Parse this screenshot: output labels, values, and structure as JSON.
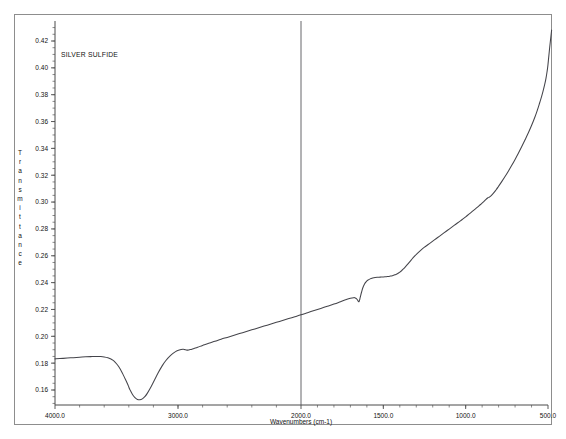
{
  "figure": {
    "series_title": "SILVER SULFIDE"
  },
  "axes": {
    "x_title": "Wavenumbers (cm-1)",
    "y_title": "Transmittance",
    "y_title_letters": [
      "T",
      "r",
      "a",
      "n",
      "s",
      "m",
      "i",
      "t",
      "t",
      "a",
      "n",
      "c",
      "e"
    ]
  },
  "chart_data": {
    "type": "line",
    "title": "SILVER SULFIDE",
    "xlabel": "Wavenumbers (cm-1)",
    "ylabel": "Transmittance",
    "xlim": [
      4000.0,
      500.0
    ],
    "ylim": [
      0.15,
      0.432
    ],
    "x_axis_inverted": true,
    "x_axis_split": {
      "note": "piecewise scale: 4000-2000 compressed, 2000-500 expanded",
      "break_at": 2000.0
    },
    "grid": false,
    "legend": "none",
    "x_major_ticks": [
      4000.0,
      3000.0,
      2000.0,
      1500.0,
      1000.0,
      500.0
    ],
    "x_major_tick_labels": [
      "4000.0",
      "3000.0",
      "2000.0",
      "1500.0",
      "1000.0",
      "500.0"
    ],
    "x_minor_tick_step_left": 200.0,
    "x_minor_tick_step_right": 100.0,
    "y_major_ticks": [
      0.16,
      0.18,
      0.2,
      0.22,
      0.24,
      0.26,
      0.28,
      0.3,
      0.32,
      0.34,
      0.36,
      0.38,
      0.4,
      0.42
    ],
    "y_major_tick_labels": [
      "0.16",
      "0.18",
      "0.20",
      "0.22",
      "0.24",
      "0.26",
      "0.28",
      "0.30",
      "0.32",
      "0.34",
      "0.36",
      "0.38",
      "0.40",
      "0.42"
    ],
    "y_minor_tick_step": 0.005,
    "series": [
      {
        "name": "SILVER SULFIDE",
        "color": "#44444a",
        "x": [
          4000,
          3960,
          3900,
          3850,
          3800,
          3750,
          3700,
          3660,
          3630,
          3600,
          3570,
          3550,
          3530,
          3510,
          3490,
          3470,
          3450,
          3430,
          3410,
          3400,
          3390,
          3370,
          3350,
          3330,
          3310,
          3290,
          3270,
          3250,
          3220,
          3190,
          3160,
          3130,
          3100,
          3060,
          3020,
          2990,
          2960,
          2940,
          2920,
          2900,
          2870,
          2840,
          2800,
          2750,
          2700,
          2650,
          2600,
          2550,
          2500,
          2450,
          2400,
          2350,
          2300,
          2250,
          2200,
          2150,
          2100,
          2050,
          2000,
          1960,
          1920,
          1880,
          1840,
          1800,
          1760,
          1730,
          1700,
          1680,
          1670,
          1660,
          1650,
          1645,
          1640,
          1632,
          1625,
          1615,
          1605,
          1595,
          1580,
          1565,
          1550,
          1535,
          1520,
          1505,
          1490,
          1475,
          1460,
          1445,
          1430,
          1415,
          1400,
          1385,
          1370,
          1350,
          1330,
          1310,
          1290,
          1270,
          1250,
          1230,
          1210,
          1190,
          1170,
          1150,
          1130,
          1110,
          1090,
          1070,
          1050,
          1030,
          1010,
          990,
          970,
          950,
          930,
          910,
          890,
          875,
          865,
          855,
          845,
          830,
          815,
          800,
          780,
          760,
          740,
          720,
          700,
          680,
          660,
          640,
          620,
          600,
          580,
          565,
          550,
          540,
          530,
          520,
          512,
          505,
          500,
          490,
          478
        ],
        "y": [
          0.1832,
          0.1834,
          0.1838,
          0.1841,
          0.1844,
          0.1847,
          0.1849,
          0.185,
          0.1849,
          0.1846,
          0.184,
          0.1833,
          0.1822,
          0.1806,
          0.1784,
          0.1756,
          0.1722,
          0.1684,
          0.1645,
          0.1622,
          0.1601,
          0.1567,
          0.1543,
          0.153,
          0.1527,
          0.1534,
          0.155,
          0.1575,
          0.1622,
          0.1676,
          0.173,
          0.1778,
          0.1818,
          0.1858,
          0.1886,
          0.1898,
          0.1903,
          0.19,
          0.1897,
          0.1901,
          0.191,
          0.1919,
          0.1932,
          0.1948,
          0.1963,
          0.1978,
          0.1992,
          0.2006,
          0.202,
          0.2034,
          0.2048,
          0.2062,
          0.2076,
          0.209,
          0.2104,
          0.2118,
          0.2132,
          0.2146,
          0.216,
          0.2176,
          0.2192,
          0.2208,
          0.2224,
          0.224,
          0.2258,
          0.2272,
          0.2284,
          0.2288,
          0.2286,
          0.2276,
          0.2258,
          0.2268,
          0.2292,
          0.233,
          0.236,
          0.2388,
          0.2406,
          0.2418,
          0.2428,
          0.2434,
          0.2438,
          0.244,
          0.2441,
          0.2442,
          0.2443,
          0.2445,
          0.2448,
          0.2452,
          0.2458,
          0.2466,
          0.2478,
          0.2494,
          0.2512,
          0.254,
          0.257,
          0.2598,
          0.2622,
          0.2644,
          0.2664,
          0.2682,
          0.27,
          0.2718,
          0.2736,
          0.2754,
          0.2772,
          0.279,
          0.2808,
          0.2826,
          0.2844,
          0.2862,
          0.288,
          0.29,
          0.292,
          0.294,
          0.296,
          0.2982,
          0.3004,
          0.3022,
          0.3032,
          0.3038,
          0.3048,
          0.3068,
          0.3092,
          0.3118,
          0.3154,
          0.3192,
          0.3232,
          0.3274,
          0.3318,
          0.3364,
          0.3412,
          0.3462,
          0.3514,
          0.357,
          0.3632,
          0.3684,
          0.3742,
          0.3782,
          0.3826,
          0.3876,
          0.3924,
          0.3978,
          0.4026,
          0.415,
          0.4282
        ],
        "annotations": [
          {
            "label": "broad O-H stretch minimum",
            "x": 3310,
            "y": 0.1527
          },
          {
            "label": "C-H notch",
            "x": 2940,
            "y": 0.19
          },
          {
            "label": "sharp H-O-H bend dip",
            "x": 1650,
            "y": 0.2258
          },
          {
            "label": "carbonate shoulder plateau",
            "x": 1460,
            "y": 0.2448
          },
          {
            "label": "small notch",
            "x": 865,
            "y": 0.3032
          },
          {
            "label": "right edge maximum",
            "x": 478,
            "y": 0.4282
          }
        ]
      }
    ]
  }
}
